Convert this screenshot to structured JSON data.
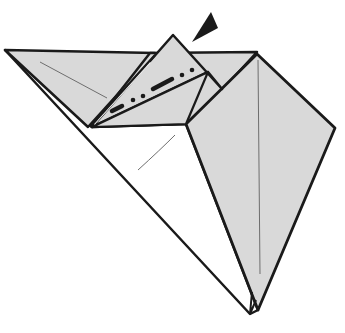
{
  "diagram": {
    "type": "origami-fold-step",
    "colors": {
      "background": "#ffffff",
      "paper_colored": "#d9d9d9",
      "paper_white": "#ffffff",
      "outline": "#1a1a1a",
      "crease": "#6e6e6e"
    },
    "elements": {
      "left_flap": "colored paper flap at upper left",
      "white_body": "white underside triangle",
      "right_kite": "colored kite-shaped flap on right",
      "center_flap": "small raised flap with mountain-fold line",
      "fold_line": "dash-dot mountain fold line",
      "arrow": "black push/sink arrowhead pointing into flap"
    }
  }
}
